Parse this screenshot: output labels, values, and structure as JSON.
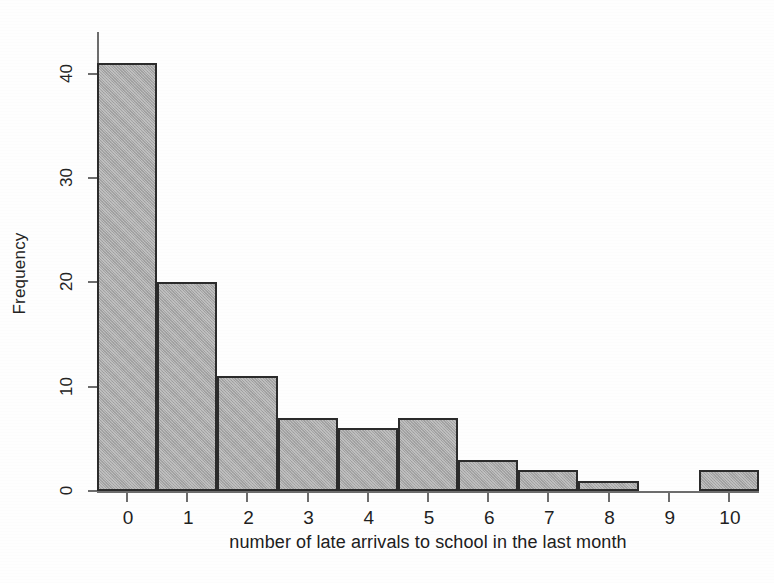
{
  "chart_data": {
    "type": "bar",
    "title": "",
    "subtitle": "",
    "xlabel": "number of late arrivals to school in the last month",
    "ylabel": "Frequency",
    "categories": [
      "0",
      "1",
      "2",
      "3",
      "4",
      "5",
      "6",
      "7",
      "8",
      "9",
      "10"
    ],
    "values": [
      41,
      20,
      11,
      7,
      6,
      7,
      3,
      2,
      1,
      0,
      2
    ],
    "x": [
      0,
      1,
      2,
      3,
      4,
      5,
      6,
      7,
      8,
      9,
      10
    ],
    "xlim": [
      -0.5,
      10.5
    ],
    "ylim": [
      0,
      44
    ],
    "ytick_labels": [
      "0",
      "10",
      "20",
      "30",
      "40"
    ],
    "ytick_values": [
      0,
      10,
      20,
      30,
      40
    ],
    "xtick_labels": [
      "0",
      "1",
      "2",
      "3",
      "4",
      "5",
      "6",
      "7",
      "8",
      "9",
      "10"
    ],
    "grid": false,
    "legend": null,
    "legend_position": "none",
    "bar_fill_color": "#a6a6a6",
    "bar_edge_color": "#2b2b2b",
    "axis_color": "#6d6d6d",
    "background_color": "#ffffff",
    "bar_width": 1,
    "annotations": []
  }
}
